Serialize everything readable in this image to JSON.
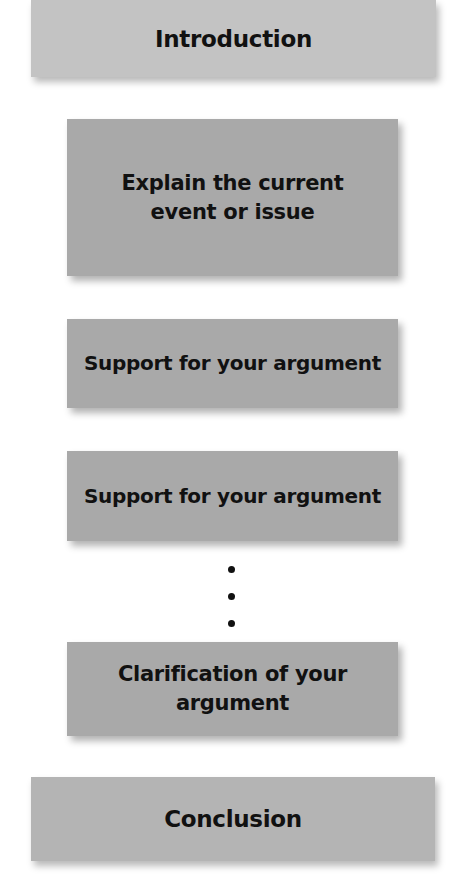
{
  "diagram": {
    "type": "vertical-flow",
    "sections": [
      {
        "id": "introduction",
        "label": "Introduction",
        "level": "outer"
      },
      {
        "id": "explain",
        "label": "Explain the current event or issue",
        "level": "inner"
      },
      {
        "id": "support-1",
        "label": "Support for your argument",
        "level": "inner"
      },
      {
        "id": "support-2",
        "label": "Support for your argument",
        "level": "inner"
      },
      {
        "id": "ellipsis",
        "label": "⋮",
        "level": "inner"
      },
      {
        "id": "clarification",
        "label": "Clarification of your argument",
        "level": "inner"
      },
      {
        "id": "conclusion",
        "label": "Conclusion",
        "level": "outer"
      }
    ],
    "colors": {
      "outer_box": "#c3c3c3",
      "inner_box": "#a9a9a9",
      "conclusion_box": "#b4b4b4",
      "text": "#111111",
      "background": "#ffffff"
    }
  }
}
